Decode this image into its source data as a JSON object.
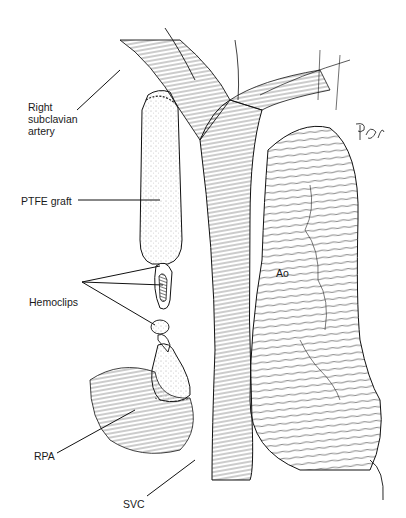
{
  "figure": {
    "labels": {
      "right_subclavian_artery": [
        "Right",
        "subclavian",
        "artery"
      ],
      "ptfe_graft": "PTFE graft",
      "hemoclips": "Hemoclips",
      "rpa": "RPA",
      "svc": "SVC",
      "ao": "Ao"
    },
    "signature": "RfL"
  }
}
